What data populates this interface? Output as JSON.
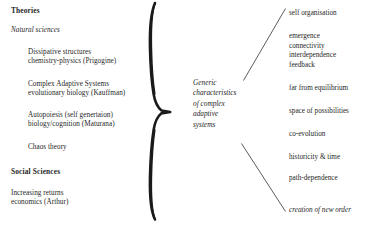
{
  "diagram": {
    "title_implicit": "Generic characteristics of complex adaptive systems",
    "center_label_lines": [
      "Generic",
      "characteristics",
      "of  complex",
      "adaptive",
      "systems"
    ],
    "brace_name": "curly-brace"
  },
  "left_column": {
    "heading_theories": "Theories",
    "subheading_natural_sciences": "Natural sciences",
    "heading_social_sciences": "Social Sciences",
    "natural_entries": [
      {
        "line1": "Dissipative structures",
        "line2": "chemistry-physics (Prigogine)"
      },
      {
        "line1": "Complex Adaptive Systems",
        "line2": "evolutionary biology (Kauffman)"
      },
      {
        "line1": "Autopoiesis (self genertaion)",
        "line2": "biology/cognition (Maturana)"
      },
      {
        "line1": "Chaos theory",
        "line2": ""
      }
    ],
    "social_entries": [
      {
        "line1": "Increasing returns",
        "line2": "economics (Arthur)"
      }
    ]
  },
  "right_column": {
    "groups": [
      {
        "items": [
          "self organisation"
        ]
      },
      {
        "items": [
          "emergence",
          "connectivity",
          "interdependence",
          "feedback"
        ]
      },
      {
        "items": [
          "far from equilibrium"
        ]
      },
      {
        "items": [
          "space of possibilities"
        ]
      },
      {
        "items": [
          "co-evolution"
        ]
      },
      {
        "items": [
          "historicity & time"
        ]
      },
      {
        "items": [
          "path-dependence"
        ]
      },
      {
        "items": [
          "creation of new order"
        ]
      }
    ]
  },
  "colors": {
    "background": "#ffffff",
    "text": "#262626",
    "ink": "#1a1a1a",
    "line": "#4a4a4a"
  }
}
